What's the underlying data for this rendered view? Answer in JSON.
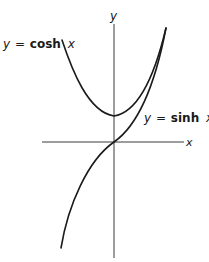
{
  "figure": {
    "axis_labels": {
      "x": "x",
      "y": "y"
    },
    "curves": [
      {
        "name": "cosh",
        "label_lhs": "y",
        "label_eq": "=",
        "label_fn": "cosh",
        "label_var": "x",
        "color": "#1a1a1a"
      },
      {
        "name": "sinh",
        "label_lhs": "y",
        "label_eq": "=",
        "label_fn": "sinh",
        "label_var": "x",
        "color": "#1a1a1a"
      }
    ],
    "colors": {
      "ink": "#1a1a1a",
      "axis": "#3a3a3a",
      "background": "#ffffff"
    }
  }
}
